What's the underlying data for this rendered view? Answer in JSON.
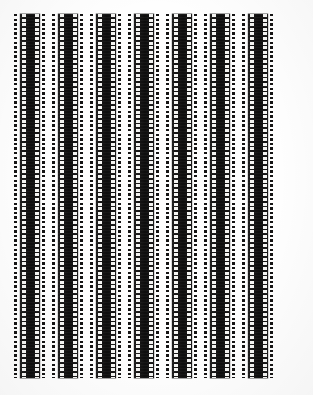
{
  "document": {
    "title": "Scanned film strips contact sheet",
    "page_width": 313,
    "page_height": 395,
    "background_color": "#fefefe",
    "description": "Seven vertical 35mm film strips arranged side by side on a white scanned page"
  },
  "palette": {
    "page": "#fefefe",
    "film_body": "#111010",
    "sprocket_hole": "#f4f4f2",
    "dot": "#151414",
    "edge_line": "#828282"
  },
  "film": {
    "strip_count": 7,
    "orientation": "vertical",
    "sprocket_pitch_px": 4.6,
    "sprocket_hole_height_px": 3,
    "sprocket_hole_width_px": 4,
    "strip_top_px": 14,
    "strip_bottom_px": 378,
    "strip_height_px": 364,
    "strips": [
      {
        "index": 1,
        "label": "strip-1",
        "body_left": 20,
        "body_width": 20,
        "left_dots": 14,
        "right_dots": 42
      },
      {
        "index": 2,
        "label": "strip-2",
        "body_left": 58,
        "body_width": 20,
        "left_dots": 52,
        "right_dots": 80
      },
      {
        "index": 3,
        "label": "strip-3",
        "body_left": 96,
        "body_width": 20,
        "left_dots": 90,
        "right_dots": 118
      },
      {
        "index": 4,
        "label": "strip-4",
        "body_left": 134,
        "body_width": 20,
        "left_dots": 128,
        "right_dots": 156
      },
      {
        "index": 5,
        "label": "strip-5",
        "body_left": 172,
        "body_width": 20,
        "left_dots": 166,
        "right_dots": 194
      },
      {
        "index": 6,
        "label": "strip-6",
        "body_left": 210,
        "body_width": 20,
        "left_dots": 204,
        "right_dots": 232
      },
      {
        "index": 7,
        "label": "strip-7",
        "body_left": 248,
        "body_width": 20,
        "left_dots": 242,
        "right_dots": 270
      }
    ]
  }
}
